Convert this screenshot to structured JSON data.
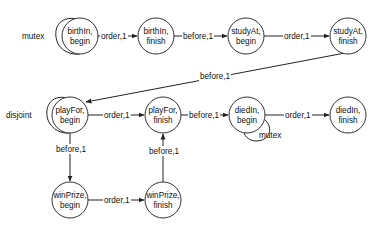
{
  "diagram": {
    "nodes": [
      {
        "id": "birthIn_begin",
        "line1": "birthIn,",
        "line2": "begin",
        "cx": 80,
        "cy": 36
      },
      {
        "id": "birthIn_finish",
        "line1": "birthIn,",
        "line2": "finish",
        "cx": 156,
        "cy": 36
      },
      {
        "id": "studyAt_begin",
        "line1": "studyAt,",
        "line2": "begin",
        "cx": 246,
        "cy": 36
      },
      {
        "id": "studyAt_finish",
        "line1": "studyAt,",
        "line2": "finish",
        "cx": 348,
        "cy": 36
      },
      {
        "id": "playFor_begin",
        "line1": "playFor,",
        "line2": "begin",
        "cx": 70,
        "cy": 115
      },
      {
        "id": "playFor_finish",
        "line1": "playFor,",
        "line2": "finish",
        "cx": 163,
        "cy": 115
      },
      {
        "id": "diedIn_begin",
        "line1": "diedIn,",
        "line2": "begin",
        "cx": 247,
        "cy": 115
      },
      {
        "id": "diedIn_finish",
        "line1": "diedIn,",
        "line2": "finish",
        "cx": 348,
        "cy": 115
      },
      {
        "id": "winPrize_begin",
        "line1": "winPrize,",
        "line2": "begin",
        "cx": 70,
        "cy": 200
      },
      {
        "id": "winPrize_finish",
        "line1": "winPrize,",
        "line2": "finish",
        "cx": 163,
        "cy": 200
      }
    ],
    "edges": [
      {
        "from": "birthIn_begin",
        "to": "birthIn_finish",
        "label": "order,1"
      },
      {
        "from": "birthIn_finish",
        "to": "studyAt_begin",
        "label": "before,1"
      },
      {
        "from": "studyAt_begin",
        "to": "studyAt_finish",
        "label": "order,1"
      },
      {
        "from": "studyAt_finish",
        "to": "playFor_begin",
        "label": "before,1"
      },
      {
        "from": "playFor_begin",
        "to": "playFor_finish",
        "label": "order,1"
      },
      {
        "from": "playFor_finish",
        "to": "diedIn_begin",
        "label": "before,1"
      },
      {
        "from": "diedIn_begin",
        "to": "diedIn_finish",
        "label": "order,1"
      },
      {
        "from": "playFor_begin",
        "to": "winPrize_begin",
        "label": "before,1"
      },
      {
        "from": "winPrize_begin",
        "to": "winPrize_finish",
        "label": "order,1"
      },
      {
        "from": "winPrize_finish",
        "to": "playFor_finish",
        "label": "before,1"
      }
    ],
    "self_loops": [
      {
        "node": "birthIn_begin",
        "label": "mutex"
      },
      {
        "node": "playFor_begin",
        "label": "disjoint"
      },
      {
        "node": "diedIn_begin",
        "label": "mutex"
      }
    ]
  }
}
